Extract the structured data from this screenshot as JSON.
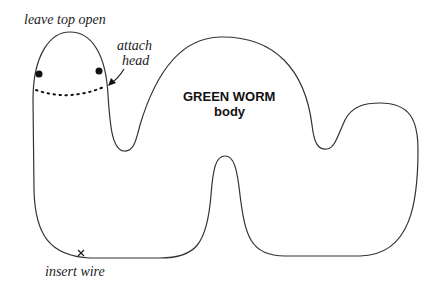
{
  "diagram": {
    "title": "GREEN WORM",
    "subtitle": "body",
    "labels": {
      "top": "leave top open",
      "attach_line1": "attach",
      "attach_line2": "head",
      "wire": "insert wire"
    },
    "colors": {
      "stroke": "#333333",
      "text": "#222222",
      "background": "#ffffff"
    }
  }
}
